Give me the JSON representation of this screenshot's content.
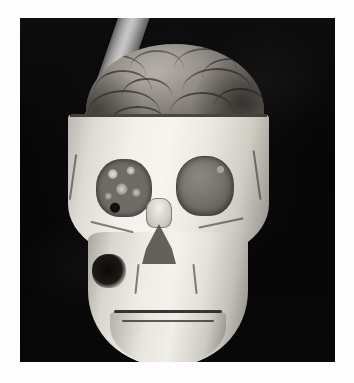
{
  "page": {
    "background_color": "#fdfdfd",
    "width": 354,
    "height": 383
  },
  "figure": {
    "panel": {
      "name": "medical-3d-rendering",
      "background_color": "#070707",
      "left": 20,
      "top": 18,
      "width": 315,
      "height": 344
    },
    "modality": "3D volume-rendered CT reconstruction",
    "view": "anterior (frontal)",
    "objects": [
      {
        "name": "skull",
        "label": "Skull",
        "color": "#f2f0ea",
        "description": "Bone-white cranium, frontal view, calvarium cut away horizontally to expose the brain"
      },
      {
        "name": "brain",
        "label": "Brain",
        "color": "#8d8881",
        "description": "Exposed cerebral cortex with gyri and sulci visible above the craniotomy cut line"
      },
      {
        "name": "rod",
        "label": "Tamping rod",
        "color": "#b9b9b9",
        "description": "Cylindrical metal rod entering the top of the cranium and exiting obliquely through the lower right of the face"
      },
      {
        "name": "orbit-left",
        "label": "Left orbit",
        "color": "#6f6c67",
        "description": "Orbital cavity filled with detailed ethmoid and orbital-wall bone fragments"
      },
      {
        "name": "orbit-right",
        "label": "Right orbit",
        "color": "#78756f",
        "description": "Smooth gray filled orbital disc"
      },
      {
        "name": "nasal-aperture",
        "label": "Nasal aperture",
        "color": "#4e4c48",
        "description": "Dark triangular piriform opening"
      },
      {
        "name": "mandible",
        "label": "Mandible",
        "color": "#e9e6e0",
        "description": "Lower jaw with dark dental occlusal line"
      }
    ],
    "caption": ""
  }
}
